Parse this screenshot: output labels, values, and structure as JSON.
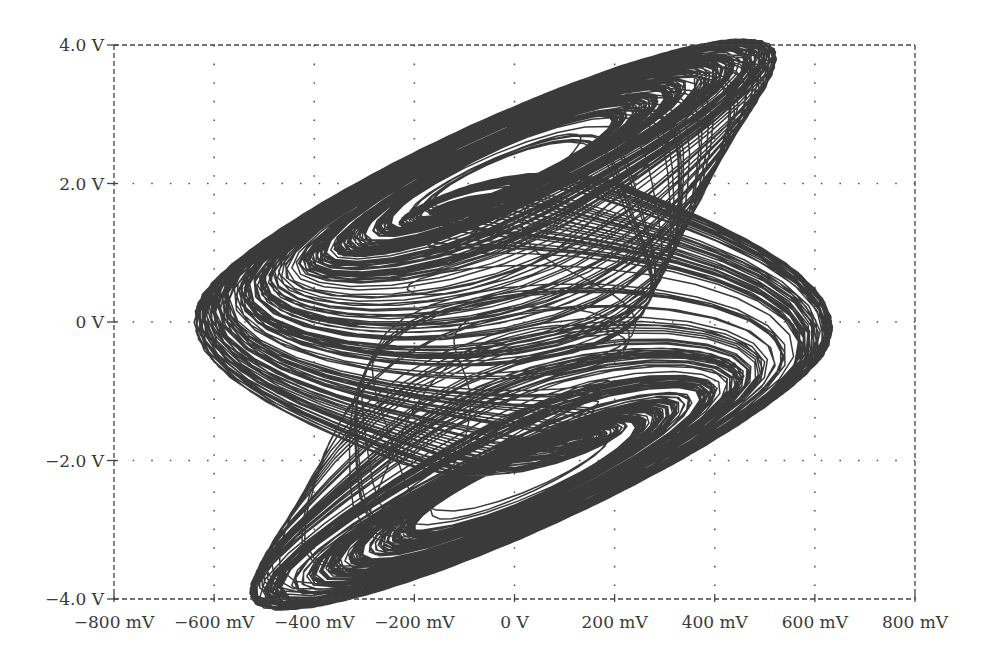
{
  "chart_data": {
    "type": "line",
    "subtype": "phase-portrait (x-y plot)",
    "title": "",
    "xlabel": "",
    "ylabel": "",
    "xlim": [
      -800,
      800
    ],
    "ylim": [
      -4.0,
      4.0
    ],
    "x_unit": "mV",
    "y_unit": "V",
    "grid": true,
    "grid_style": "dotted",
    "legend": null,
    "x_ticks": [
      -800,
      -600,
      -400,
      -200,
      0,
      200,
      400,
      600,
      800
    ],
    "x_tick_labels": [
      "−800 mV",
      "−600 mV",
      "−400 mV",
      "−200 mV",
      "0 V",
      "200 mV",
      "400 mV",
      "600 mV",
      "800 mV"
    ],
    "y_ticks": [
      4.0,
      2.0,
      0,
      -2.0,
      -4.0
    ],
    "y_tick_labels": [
      "4.0 V",
      "2.0 V",
      "0 V",
      "−2.0 V",
      "−4.0 V"
    ],
    "series": [
      {
        "name": "double-scroll attractor",
        "color": "#3c3c3c",
        "description": "Chaotic double-scroll trajectory with two lobes centered near (15 mV, 2.0 V) and (20 mV, -2.1 V)",
        "key_points": {
          "upper_lobe_left_tip": [
            -634,
            1.18
          ],
          "upper_lobe_right_tip": [
            622,
            2.84
          ],
          "upper_lobe_top": [
            330,
            3.42
          ],
          "upper_lobe_hole_center": [
            12,
            2.0
          ],
          "lower_lobe_left_tip": [
            -618,
            -2.79
          ],
          "lower_lobe_right_tip": [
            632,
            -1.17
          ],
          "lower_lobe_bottom": [
            -408,
            -3.47
          ],
          "lower_lobe_hole_center": [
            20,
            -2.1
          ]
        }
      }
    ]
  },
  "plot": {
    "frame_color": "#444444",
    "grid_color": "#555555",
    "line_color": "#3a3a3a"
  }
}
